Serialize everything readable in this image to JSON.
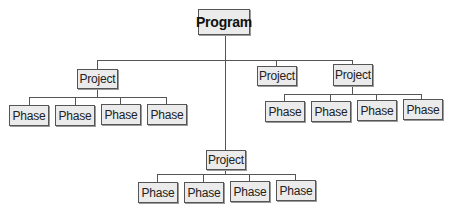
{
  "diagram": {
    "type": "org-chart-hierarchy",
    "root": {
      "label": "Program"
    },
    "projects": [
      {
        "label": "Project",
        "phases": [
          "Phase",
          "Phase",
          "Phase",
          "Phase"
        ]
      },
      {
        "label": "Project",
        "phases": []
      },
      {
        "label": "Project",
        "phases": [
          "Phase",
          "Phase",
          "Phase",
          "Phase"
        ]
      },
      {
        "label": "Project",
        "phases": [
          "Phase",
          "Phase",
          "Phase",
          "Phase"
        ]
      }
    ]
  },
  "colors": {
    "box_fill": "#ebebeb",
    "box_border": "#555555",
    "line": "#555555",
    "background": "#ffffff"
  }
}
